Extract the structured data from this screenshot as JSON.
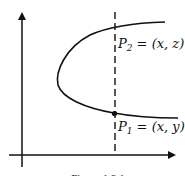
{
  "figure": {
    "points": [
      {
        "name": "P2",
        "label_main": "P",
        "label_sub": "2",
        "label_rest": " = (x, z)"
      },
      {
        "name": "P1",
        "label_main": "P",
        "label_sub": "1",
        "label_rest": " = (x, y)"
      }
    ],
    "caption": "Figure 1.3.1",
    "colors": {
      "stroke": "#111111",
      "background": "#ffffff"
    }
  }
}
